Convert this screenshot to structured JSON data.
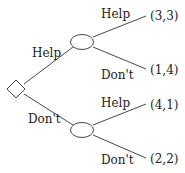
{
  "diagram": {
    "type": "game-tree",
    "root": {
      "shape": "diamond",
      "branches": [
        {
          "label": "Help",
          "node": {
            "shape": "ellipse",
            "branches": [
              {
                "label": "Help",
                "payoff": "(3,3)"
              },
              {
                "label": "Don't",
                "payoff": "(1,4)"
              }
            ]
          }
        },
        {
          "label": "Don't",
          "node": {
            "shape": "ellipse",
            "branches": [
              {
                "label": "Help",
                "payoff": "(4,1)"
              },
              {
                "label": "Don't",
                "payoff": "(2,2)"
              }
            ]
          }
        }
      ]
    },
    "colors": {
      "line": "#333333",
      "text": "#222222",
      "background": "#ffffff"
    }
  }
}
